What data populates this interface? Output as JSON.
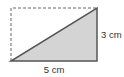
{
  "diagram": {
    "type": "right-triangle-in-rectangle",
    "labels": {
      "base": "5 cm",
      "height": "3 cm"
    },
    "colors": {
      "triangle_fill": "#d4d4d4",
      "triangle_stroke": "#555555",
      "dashed_stroke": "#666666",
      "text": "#333333"
    }
  }
}
